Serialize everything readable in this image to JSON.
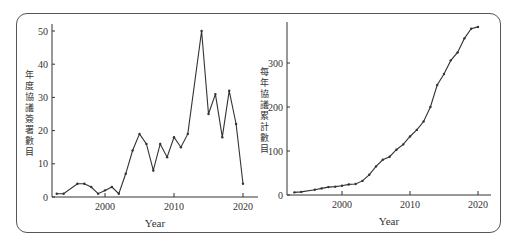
{
  "chart_data": [
    {
      "type": "line",
      "title": "",
      "xlabel": "Year",
      "ylabel": "年度協議簽署數目",
      "xlim": [
        1993,
        2020
      ],
      "ylim": [
        0,
        52
      ],
      "x_ticks": [
        2000,
        2010,
        2020
      ],
      "y_ticks": [
        0,
        10,
        20,
        30,
        40,
        50
      ],
      "grid": false,
      "x": [
        1993,
        1994,
        1996,
        1997,
        1998,
        1999,
        2000,
        2001,
        2002,
        2003,
        2004,
        2005,
        2006,
        2007,
        2008,
        2009,
        2010,
        2011,
        2012,
        2014,
        2015,
        2016,
        2017,
        2018,
        2019,
        2020
      ],
      "values": [
        1,
        1,
        4,
        4,
        3,
        1,
        2,
        3,
        1,
        7,
        14,
        19,
        16,
        8,
        16,
        12,
        18,
        15,
        19,
        50,
        25,
        31,
        18,
        32,
        22,
        4
      ]
    },
    {
      "type": "line",
      "title": "",
      "xlabel": "Year",
      "ylabel": "每年協議累計數目",
      "xlim": [
        1993,
        2020
      ],
      "ylim": [
        0,
        390
      ],
      "x_ticks": [
        2000,
        2010,
        2020
      ],
      "y_ticks": [
        0,
        100,
        200,
        300
      ],
      "grid": false,
      "x": [
        1993,
        1994,
        1996,
        1997,
        1998,
        1999,
        2000,
        2001,
        2002,
        2003,
        2004,
        2005,
        2006,
        2007,
        2008,
        2009,
        2010,
        2011,
        2012,
        2013,
        2014,
        2015,
        2016,
        2017,
        2018,
        2019,
        2020
      ],
      "values": [
        6,
        7,
        12,
        15,
        18,
        19,
        21,
        24,
        25,
        32,
        46,
        65,
        80,
        87,
        103,
        115,
        133,
        148,
        167,
        200,
        250,
        275,
        306,
        324,
        356,
        378,
        382
      ]
    }
  ],
  "left": {
    "xlabel": "Year",
    "ylabel_chars": [
      "年",
      "度",
      "協",
      "議",
      "簽",
      "署",
      "數",
      "目"
    ],
    "yticks": [
      "0",
      "10",
      "20",
      "30",
      "40",
      "50"
    ],
    "xticks": [
      "2000",
      "2010",
      "2020"
    ]
  },
  "right": {
    "xlabel": "Year",
    "ylabel_chars": [
      "每",
      "年",
      "協",
      "議",
      "累",
      "計",
      "數",
      "目"
    ],
    "yticks": [
      "0",
      "100",
      "200",
      "300"
    ],
    "xticks": [
      "2000",
      "2010",
      "2020"
    ]
  }
}
